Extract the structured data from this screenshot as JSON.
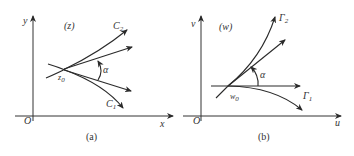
{
  "panels": [
    {
      "id": "a",
      "caption": "(a)",
      "plane_label": "(z)",
      "x_axis_label": "x",
      "y_axis_label": "y",
      "origin_label": "O",
      "point_label": "z",
      "point_subscript": "0",
      "angle_label": "α",
      "curves": [
        {
          "name": "C",
          "subscript": "2"
        },
        {
          "name": "C",
          "subscript": "1"
        }
      ]
    },
    {
      "id": "b",
      "caption": "(b)",
      "plane_label": "(w)",
      "x_axis_label": "u",
      "y_axis_label": "v",
      "origin_label": "O",
      "point_label": "w",
      "point_subscript": "0",
      "angle_label": "α",
      "curves": [
        {
          "name": "Γ",
          "subscript": "2"
        },
        {
          "name": "Γ",
          "subscript": "1"
        }
      ]
    }
  ],
  "colors": {
    "ink": "#2a2a2a",
    "background": "#ffffff"
  }
}
